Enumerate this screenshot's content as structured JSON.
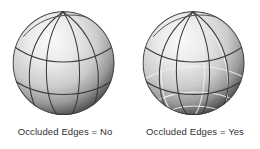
{
  "figure": {
    "background_color": "#ffffff",
    "panels": [
      {
        "id": "occluded-no",
        "caption": "Occluded Edges = No",
        "show_occluded_edges": false,
        "object": "sphere"
      },
      {
        "id": "occluded-yes",
        "caption": "Occluded Edges = Yes",
        "show_occluded_edges": true,
        "object": "sphere"
      }
    ]
  },
  "render": {
    "visible_edge_color": "#3a3a3a",
    "occluded_edge_color": "#f2f2f2",
    "surface_light_color": "#f4f4f4",
    "surface_mid_color": "#c2c2c2",
    "surface_dark_color": "#3d3d3d",
    "caption_color": "#2f2f2f"
  }
}
